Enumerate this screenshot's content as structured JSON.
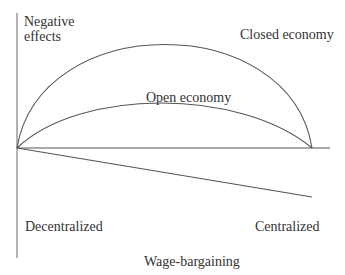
{
  "diagram": {
    "y_axis_label": "Negative effects",
    "x_axis_label": "Wage-bargaining",
    "x_left_label": "Decentralized",
    "x_right_label": "Centralized",
    "curves": [
      {
        "name": "Closed economy",
        "label": "Closed economy",
        "shape": "arc",
        "peak_y": 42
      },
      {
        "name": "Open economy",
        "label": "Open economy",
        "shape": "arc",
        "peak_y": 113
      },
      {
        "name": "baseline",
        "shape": "line"
      },
      {
        "name": "descending",
        "shape": "line"
      }
    ],
    "line_color": "#555555",
    "text_color": "#333333"
  }
}
